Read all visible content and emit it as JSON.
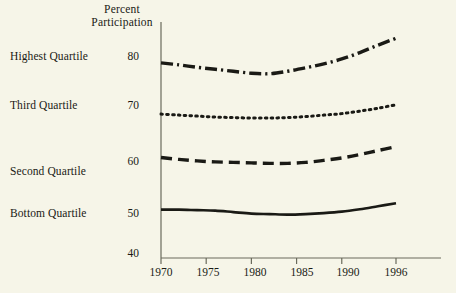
{
  "chart_data": {
    "type": "line",
    "title": "Percent Participation",
    "title_lines": [
      "Percent",
      "Participation"
    ],
    "xlabel": "",
    "ylabel": "Percent Participation",
    "xlim": [
      1970,
      1996
    ],
    "ylim": [
      40,
      85
    ],
    "grid": false,
    "legend_position": "left-inline",
    "x_tick_labels": [
      "1970",
      "1975",
      "1980",
      "1985",
      "1990",
      "1996"
    ],
    "x_ticks": [
      1970,
      1975,
      1980,
      1985,
      1990,
      1996
    ],
    "y_tick_labels": [
      "80",
      "70",
      "60",
      "50",
      "40"
    ],
    "y_ticks": [
      80,
      70,
      60,
      50,
      40
    ],
    "x": [
      1970,
      1972,
      1974,
      1976,
      1978,
      1980,
      1982,
      1984,
      1986,
      1988,
      1990,
      1992,
      1994,
      1996
    ],
    "series": [
      {
        "name": "Highest Quartile",
        "style": "dash-dot",
        "color": "#1a1a15",
        "values": [
          78.6,
          78.2,
          77.7,
          77.3,
          76.9,
          76.5,
          76.4,
          76.9,
          77.6,
          78.4,
          79.4,
          80.7,
          82.2,
          83.6
        ]
      },
      {
        "name": "Third Quartile",
        "style": "dotted",
        "color": "#1a1a15",
        "values": [
          68.2,
          68.0,
          67.8,
          67.6,
          67.5,
          67.4,
          67.4,
          67.5,
          67.7,
          68.0,
          68.3,
          68.8,
          69.4,
          70.1
        ]
      },
      {
        "name": "Second Quartile",
        "style": "dashed",
        "color": "#1a1a15",
        "values": [
          59.4,
          59.0,
          58.7,
          58.5,
          58.4,
          58.3,
          58.2,
          58.2,
          58.4,
          58.8,
          59.3,
          60.0,
          60.8,
          61.6
        ]
      },
      {
        "name": "Bottom Quartile",
        "style": "solid",
        "color": "#1a1a15",
        "values": [
          48.8,
          48.8,
          48.7,
          48.6,
          48.3,
          48.0,
          47.9,
          47.8,
          47.9,
          48.1,
          48.4,
          48.9,
          49.5,
          50.1
        ]
      }
    ]
  },
  "labels": {
    "highest_quartile": "Highest Quartile",
    "third_quartile": "Third Quartile",
    "second_quartile": "Second Quartile",
    "bottom_quartile": "Bottom Quartile"
  },
  "y_labels": {
    "t80": "80",
    "t70": "70",
    "t60": "60",
    "t50": "50",
    "t40": "40"
  },
  "x_labels": {
    "t1970": "1970",
    "t1975": "1975",
    "t1980": "1980",
    "t1985": "1985",
    "t1990": "1990",
    "t1996": "1996"
  },
  "title": {
    "line1": "Percent",
    "line2": "Participation"
  },
  "colors": {
    "background": "#f6f5e8",
    "ink": "#1a1a15",
    "axis": "#6a6a5c"
  }
}
